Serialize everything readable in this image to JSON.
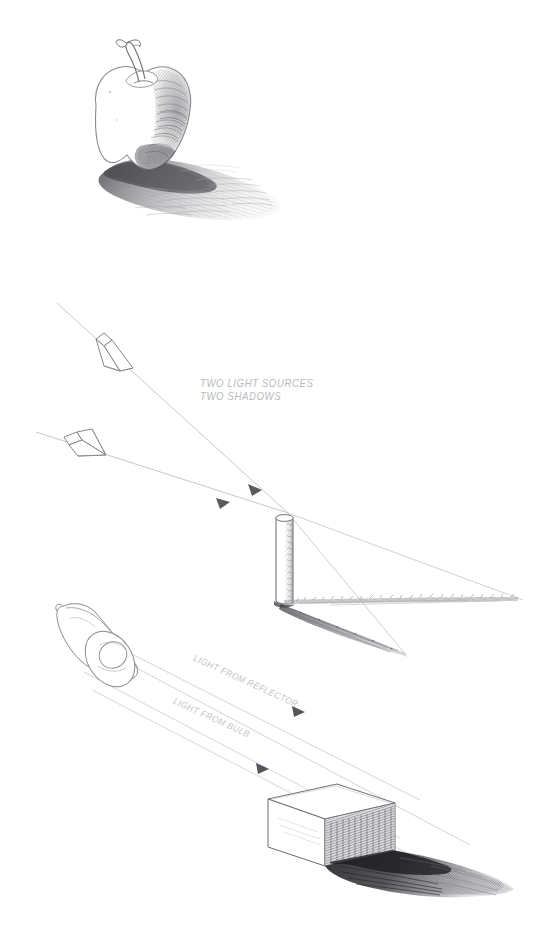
{
  "page": {
    "background_color": "#ffffff",
    "medium": "pencil drawing",
    "ink_color": "#8a8a8e",
    "width": 542,
    "height": 943
  },
  "captions": {
    "two_light_sources": {
      "line1": "TWO LIGHT SOURCES",
      "line2": "TWO SHADOWS",
      "color": "#b9b9bd"
    },
    "light_from_reflector": {
      "text": "LIGHT FROM REFLECTOR",
      "color": "#c2c2c6",
      "rotation_deg": 24.5
    },
    "light_from_bulb": {
      "text": "LIGHT FROM BULB",
      "color": "#c4c4c8",
      "rotation_deg": 24.5
    }
  },
  "figures": [
    {
      "id": "apple-figure",
      "name": "apple-with-cast-shadow",
      "subject": "apple",
      "shadow": "single cast shadow to the lower right",
      "light_direction": "upper left"
    },
    {
      "id": "cylinder-figure",
      "name": "cylinder-with-two-shadows",
      "subject": "vertical cylinder",
      "shadow_count": 2,
      "light_sources": 2,
      "arrow_count": 2
    },
    {
      "id": "lamp-figure",
      "name": "reflector-lamp-and-box",
      "subject": "reflector lamp and rectangular box",
      "shadow": "dark cast shadow to the right of the box",
      "ray_groups": 2
    }
  ]
}
